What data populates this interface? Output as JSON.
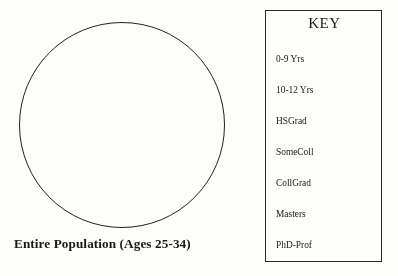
{
  "figure": {
    "population": {
      "shape": "circle",
      "caption": "Entire Population (Ages 25-34)"
    },
    "key": {
      "title": "KEY",
      "items": [
        {
          "label": "0-9 Yrs"
        },
        {
          "label": "10-12 Yrs"
        },
        {
          "label": "HSGrad"
        },
        {
          "label": "SomeColl"
        },
        {
          "label": "CollGrad"
        },
        {
          "label": "Masters"
        },
        {
          "label": "PhD-Prof"
        }
      ]
    }
  },
  "colors": {
    "ink": "#1b1917",
    "stroke": "#23211f",
    "page": "#ffffff"
  }
}
